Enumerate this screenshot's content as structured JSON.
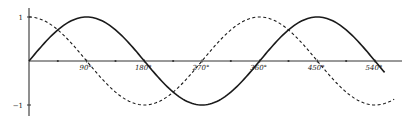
{
  "chart_data": {
    "type": "line",
    "title": "",
    "xlabel": "",
    "ylabel": "",
    "x_unit": "degrees",
    "xlim": [
      0,
      570
    ],
    "ylim": [
      -1,
      1
    ],
    "grid": false,
    "legend": null,
    "x_ticks": [
      90,
      180,
      270,
      360,
      450,
      540
    ],
    "x_tick_labels": [
      "90°",
      "180°",
      "270°",
      "360°",
      "450°",
      "540°"
    ],
    "x_minor_ticks": [
      45,
      135,
      225,
      315,
      405,
      495
    ],
    "y_ticks": [
      1,
      -1
    ],
    "y_tick_labels": [
      "1",
      "−1"
    ],
    "series": [
      {
        "name": "sin x",
        "style": "solid",
        "function": "sin",
        "x_range": [
          0,
          555
        ],
        "x": [
          0,
          90,
          180,
          270,
          360,
          450,
          540,
          555
        ],
        "values": [
          0,
          1,
          0,
          -1,
          0,
          1,
          0,
          -0.26
        ]
      },
      {
        "name": "cos x",
        "style": "dashed",
        "function": "cos",
        "x_range": [
          0,
          570
        ],
        "x": [
          0,
          90,
          180,
          270,
          360,
          450,
          540,
          570
        ],
        "values": [
          1,
          0,
          -1,
          0,
          1,
          0,
          -1,
          -0.87
        ]
      }
    ]
  },
  "colors": {
    "axis": "#333333",
    "curve": "#1a1a1a",
    "background": "#ffffff"
  }
}
